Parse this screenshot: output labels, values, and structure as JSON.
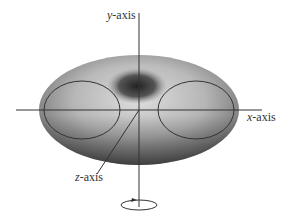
{
  "diagram": {
    "labels": {
      "y_axis": {
        "var": "y",
        "suffix": "-axis"
      },
      "x_axis": {
        "var": "x",
        "suffix": "-axis"
      },
      "z_axis": {
        "var": "z",
        "suffix": "-axis"
      }
    },
    "colors": {
      "line": "#333333",
      "torus_light": "#d8d8d8",
      "torus_dark": "#3a3a3a"
    }
  }
}
